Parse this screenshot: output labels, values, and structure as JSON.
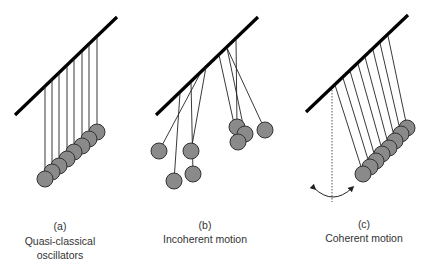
{
  "panels": [
    {
      "id": "a",
      "tag": "(a)",
      "caption_line1": "Quasi-classical",
      "caption_line2": "oscillators"
    },
    {
      "id": "b",
      "tag": "(b)",
      "caption_line1": "Incoherent motion"
    },
    {
      "id": "c",
      "tag": "(c)",
      "caption_line1": "Coherent motion"
    }
  ],
  "colors": {
    "bar": "#000000",
    "string": "#222222",
    "ball_fill": "#8a8a8a",
    "ball_stroke": "#333333",
    "text": "#333333"
  }
}
